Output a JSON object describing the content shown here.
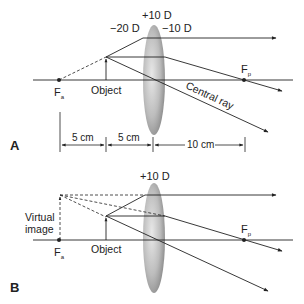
{
  "panels": [
    {
      "id": "A",
      "panel_label": "A",
      "lens_power_center": "+10 D",
      "lens_power_left": "−20 D",
      "lens_power_right": "−10 D",
      "object_label": "Object",
      "focal_anterior": {
        "main": "F",
        "sub": "a"
      },
      "focal_posterior": {
        "main": "F",
        "sub": "p"
      },
      "central_ray_label": "Central ray",
      "dimensions": [
        "5 cm",
        "5 cm",
        "10 cm"
      ]
    },
    {
      "id": "B",
      "panel_label": "B",
      "lens_power_center": "+10 D",
      "object_label": "Object",
      "virtual_image_label_line1": "Virtual",
      "virtual_image_label_line2": "image",
      "focal_anterior": {
        "main": "F",
        "sub": "a"
      },
      "focal_posterior": {
        "main": "F",
        "sub": "p"
      }
    }
  ],
  "colors": {
    "line": "#222222",
    "lens_light": "#e6e6e6",
    "lens_dark": "#8a8a8a"
  }
}
